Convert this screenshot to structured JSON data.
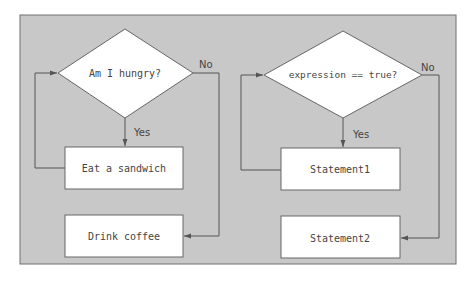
{
  "colors": {
    "page_background": "#ffffff",
    "panel_background": "#c8c8c8",
    "panel_border": "#707070",
    "shape_fill": "#ffffff",
    "line": "#555555",
    "text": "#444444"
  },
  "flowcharts": [
    {
      "id": "left",
      "decision": "Am I hungry?",
      "yes_label": "Yes",
      "no_label": "No",
      "loop_body": "Eat a sandwich",
      "after_loop": "Drink coffee"
    },
    {
      "id": "right",
      "decision": "expression == true?",
      "yes_label": "Yes",
      "no_label": "No",
      "loop_body": "Statement1",
      "after_loop": "Statement2"
    }
  ]
}
